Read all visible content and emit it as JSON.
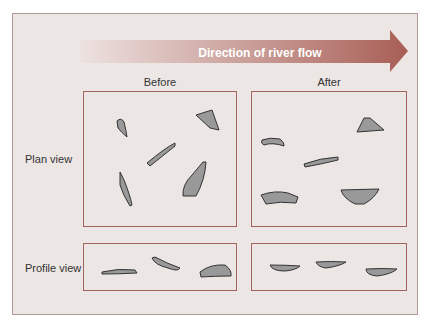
{
  "arrow": {
    "label": "Direction of river flow"
  },
  "columns": [
    {
      "label": "Before"
    },
    {
      "label": "After"
    }
  ],
  "rows": [
    {
      "label": "Plan view"
    },
    {
      "label": "Profile view"
    }
  ],
  "colors": {
    "frame_bg": "#ece6e5",
    "box_border": "#a0645c",
    "arrow_start": "#ede2e0",
    "arrow_end": "#a85e55",
    "stone_fill": "#999999",
    "stone_stroke": "#333333"
  }
}
